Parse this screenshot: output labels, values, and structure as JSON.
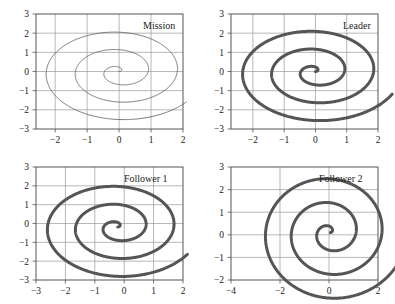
{
  "figure": {
    "background": "#ffffff",
    "axis_color": "#555555",
    "grid_color": "#9a9a9a",
    "curve_color": "#555555",
    "panel_count": 4
  },
  "chart_data": [
    {
      "type": "line",
      "title": "Mission",
      "xlabel": "",
      "ylabel": "",
      "xlim": [
        -2.6,
        2.0
      ],
      "ylim": [
        -3.0,
        3.0
      ],
      "xticks": [
        -2,
        -1,
        0,
        1,
        2
      ],
      "yticks": [
        -3,
        -2,
        -1,
        0,
        1,
        2,
        3
      ],
      "xtick_labels": [
        "-2",
        "-1",
        "0",
        "1",
        "2"
      ],
      "ytick_labels": [
        "-3",
        "-2",
        "-1",
        "0",
        "1",
        "2",
        "3"
      ],
      "grid": true,
      "legend": "none",
      "line_width": 0.8,
      "series": [
        {
          "name": "mission-spiral",
          "description": "Archimedean spiral unwinding counter-clockwise from origin outward, r = 0.145 * theta, theta from 0 to 18.2 rad, ending near (-1.0, 2.8)",
          "spiral": {
            "r_coefficient": 0.145,
            "theta_start": 0.0,
            "theta_end": 18.2,
            "center_x": 0.0,
            "center_y": 0.0,
            "phase": 0.0,
            "direction": "counter-clockwise"
          }
        }
      ]
    },
    {
      "type": "line",
      "title": "Leader",
      "xlabel": "",
      "ylabel": "",
      "xlim": [
        -2.7,
        2.0
      ],
      "ylim": [
        -3.0,
        3.0
      ],
      "xticks": [
        -2,
        -1,
        0,
        1,
        2
      ],
      "yticks": [
        -3,
        -2,
        -1,
        0,
        1,
        2,
        3
      ],
      "xtick_labels": [
        "-2",
        "-1",
        "0",
        "1",
        "2"
      ],
      "ytick_labels": [
        "-3",
        "-2",
        "-1",
        "0",
        "1",
        "2",
        "3"
      ],
      "grid": true,
      "legend": "none",
      "line_width": 3.0,
      "series": [
        {
          "name": "leader-spiral",
          "description": "Thick Archimedean spiral from origin outward ending near (-1.0, 2.85)",
          "spiral": {
            "r_coefficient": 0.148,
            "theta_start": 0.0,
            "theta_end": 18.4,
            "center_x": 0.0,
            "center_y": 0.0,
            "phase": 0.0,
            "direction": "counter-clockwise"
          }
        }
      ]
    },
    {
      "type": "line",
      "title": "Follower 1",
      "xlabel": "",
      "ylabel": "",
      "xlim": [
        -3.0,
        2.0
      ],
      "ylim": [
        -3.0,
        3.0
      ],
      "xticks": [
        -3,
        -2,
        -1,
        0,
        1,
        2
      ],
      "yticks": [
        -3,
        -2,
        -1,
        0,
        1,
        2,
        3
      ],
      "xtick_labels": [
        "-3",
        "-2",
        "-1",
        "0",
        "1",
        "2"
      ],
      "ytick_labels": [
        "-3",
        "-2",
        "-1",
        "0",
        "1",
        "2",
        "3"
      ],
      "grid": true,
      "legend": "none",
      "line_width": 3.0,
      "series": [
        {
          "name": "follower1-spiral",
          "description": "Thick Archimedean spiral centered slightly left of origin, ending near (-1.1, 2.6)",
          "spiral": {
            "r_coefficient": 0.152,
            "theta_start": 0.0,
            "theta_end": 18.3,
            "center_x": -0.22,
            "center_y": -0.18,
            "phase": 0.0,
            "direction": "counter-clockwise"
          }
        }
      ]
    },
    {
      "type": "line",
      "title": "Follower 2",
      "xlabel": "",
      "ylabel": "",
      "xlim": [
        -4.0,
        2.0
      ],
      "ylim": [
        -2.0,
        3.0
      ],
      "xticks": [
        -4,
        -2,
        0,
        2
      ],
      "yticks": [
        -2,
        -1,
        0,
        1,
        2,
        3
      ],
      "xtick_labels": [
        "-4",
        "-2",
        "0",
        "2"
      ],
      "ytick_labels": [
        "-2",
        "-1",
        "0",
        "1",
        "2",
        "3"
      ],
      "grid": true,
      "legend": "none",
      "line_width": 3.0,
      "series": [
        {
          "name": "follower2-spiral",
          "description": "Thick Archimedean spiral from origin outward ending near (-0.8, 3.0)",
          "spiral": {
            "r_coefficient": 0.168,
            "theta_start": 0.0,
            "theta_end": 18.6,
            "center_x": 0.05,
            "center_y": 0.1,
            "phase": 0.0,
            "direction": "counter-clockwise"
          }
        }
      ]
    }
  ],
  "panels": [
    {
      "key": "mission",
      "title": "Mission",
      "title_left": 143,
      "title_top": 21,
      "frame": {
        "left": 36,
        "top": 14,
        "width": 147,
        "height": 115
      }
    },
    {
      "key": "leader",
      "title": "Leader",
      "title_left": 343,
      "title_top": 21,
      "frame": {
        "left": 231,
        "top": 14,
        "width": 147,
        "height": 115
      }
    },
    {
      "key": "follower1",
      "title": "Follower 1",
      "title_left": 124,
      "title_top": 174,
      "frame": {
        "left": 36,
        "top": 167,
        "width": 147,
        "height": 113
      }
    },
    {
      "key": "follower2",
      "title": "Follower 2",
      "title_left": 319,
      "title_top": 174,
      "frame": {
        "left": 231,
        "top": 167,
        "width": 147,
        "height": 113
      }
    }
  ]
}
